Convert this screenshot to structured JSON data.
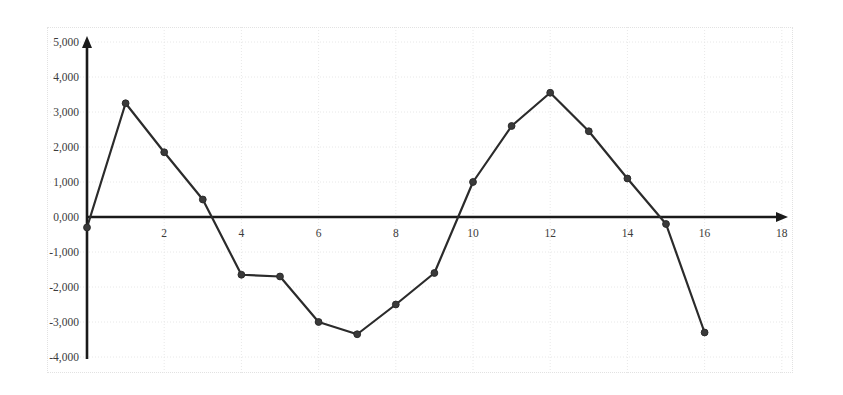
{
  "chart_data": {
    "type": "line",
    "title": "",
    "subtitle": "",
    "xlabel": "",
    "ylabel": "",
    "x": [
      0,
      1,
      2,
      3,
      4,
      5,
      6,
      7,
      8,
      9,
      10,
      11,
      12,
      13,
      14,
      15,
      16
    ],
    "values": [
      -0.3,
      3.25,
      1.85,
      0.5,
      -1.65,
      -1.7,
      -3.0,
      -3.35,
      -2.5,
      -1.6,
      1.0,
      2.6,
      3.55,
      2.45,
      1.1,
      -0.2,
      -3.3
    ],
    "series": [
      {
        "name": "series-1",
        "values": [
          -0.3,
          3.25,
          1.85,
          0.5,
          -1.65,
          -1.7,
          -3.0,
          -3.35,
          -2.5,
          -1.6,
          1.0,
          2.6,
          3.55,
          2.45,
          1.1,
          -0.2,
          -3.3
        ]
      }
    ],
    "xlim": [
      0,
      18.5
    ],
    "ylim": [
      -4.0,
      5.0
    ],
    "x_ticks": [
      2,
      4,
      6,
      8,
      10,
      12,
      14,
      16,
      18
    ],
    "x_tick_labels": [
      "2",
      "4",
      "6",
      "8",
      "10",
      "12",
      "14",
      "16",
      "18"
    ],
    "y_ticks": [
      5,
      4,
      3,
      2,
      1,
      0,
      -1,
      -2,
      -3,
      -4
    ],
    "y_tick_labels": [
      "5,000",
      "4,000",
      "3,000",
      "2,000",
      "1,000",
      "0,000",
      "-1,000",
      "-2,000",
      "-3,000",
      "-4,000"
    ],
    "grid": true,
    "legend": null,
    "legend_position": "none",
    "marker": "circle",
    "line_color": "#2b2b2b",
    "marker_color": "#3a3a3a",
    "grid_color": "#e8e8e8",
    "axis_color": "#1a1a1a",
    "tick_label_color": "#3b3b3b",
    "background_color": "#ffffff",
    "x_axis_arrow": true,
    "y_axis_arrow": true
  }
}
